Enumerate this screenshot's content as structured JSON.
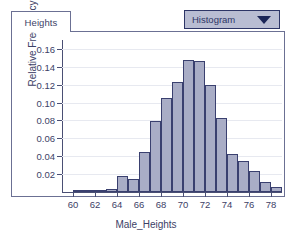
{
  "window": {
    "tab_label": "Heights"
  },
  "dropdown": {
    "selected": "Histogram",
    "arrow_icon": "chevron-down-icon",
    "fill_color": "#b9bdd2",
    "border_color": "#2d3566"
  },
  "chart_data": {
    "type": "bar",
    "title": "",
    "subtitle": "",
    "xlabel": "Male_Heights",
    "ylabel": "Relative Frequency",
    "grid": true,
    "legend": "none",
    "xlim": [
      59,
      79
    ],
    "ylim": [
      0,
      0.17
    ],
    "xticks": [
      "60",
      "62",
      "64",
      "66",
      "68",
      "70",
      "72",
      "74",
      "76",
      "78"
    ],
    "xtick_values": [
      60,
      62,
      64,
      66,
      68,
      70,
      72,
      74,
      76,
      78
    ],
    "yticks": [
      "0.02",
      "0.04",
      "0.06",
      "0.08",
      "0.10",
      "0.12",
      "0.14",
      "0.16"
    ],
    "ytick_values": [
      0.02,
      0.04,
      0.06,
      0.08,
      0.1,
      0.12,
      0.14,
      0.16
    ],
    "bin_width": 1,
    "categories": [
      60,
      61,
      62,
      63,
      64,
      65,
      66,
      67,
      68,
      69,
      70,
      71,
      72,
      73,
      74,
      75,
      76,
      77,
      78
    ],
    "values": [
      0.002,
      0.002,
      0.002,
      0.003,
      0.018,
      0.015,
      0.045,
      0.079,
      0.105,
      0.123,
      0.148,
      0.147,
      0.12,
      0.083,
      0.042,
      0.035,
      0.024,
      0.011,
      0.006
    ],
    "bar_fill_color": "#a9adc6",
    "bar_border_color": "#3a406f"
  }
}
